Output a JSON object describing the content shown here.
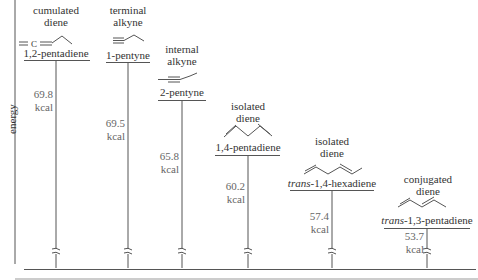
{
  "diagram": {
    "type": "energy-level diagram",
    "axis_label": "energy",
    "unit": "kcal",
    "colors": {
      "lines": "#555555",
      "text": "#333333",
      "values": "#666666"
    },
    "levels": [
      {
        "category_line1": "cumulated",
        "category_line2": "diene",
        "structure": "=C=",
        "name": "1,2-pentadiene",
        "name_prefix": "",
        "value": "69.8",
        "unit": "kcal"
      },
      {
        "category_line1": "terminal",
        "category_line2": "alkyne",
        "structure": "≡",
        "name": "1-pentyne",
        "name_prefix": "",
        "value": "69.5",
        "unit": "kcal"
      },
      {
        "category_line1": "internal",
        "category_line2": "alkyne",
        "structure": "≡",
        "name": "2-pentyne",
        "name_prefix": "",
        "value": "65.8",
        "unit": "kcal"
      },
      {
        "category_line1": "isolated",
        "category_line2": "diene",
        "structure": "",
        "name": "1,4-pentadiene",
        "name_prefix": "",
        "value": "60.2",
        "unit": "kcal"
      },
      {
        "category_line1": "isolated",
        "category_line2": "diene",
        "structure": "",
        "name": "-1,4-hexadiene",
        "name_prefix": "trans",
        "value": "57.4",
        "unit": "kcal"
      },
      {
        "category_line1": "conjugated",
        "category_line2": "diene",
        "structure": "",
        "name": "-1,3-pentadiene",
        "name_prefix": "trans",
        "value": "53.7",
        "unit": "kcal"
      }
    ]
  }
}
